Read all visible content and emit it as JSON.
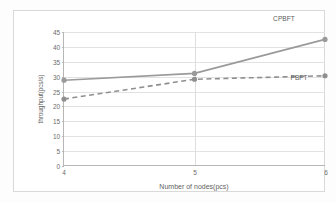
{
  "chart_data": {
    "type": "line",
    "title": "",
    "xlabel": "Number of nodes(pcs)",
    "ylabel": "throughput(pcs/s)",
    "categories": [
      4,
      5,
      6
    ],
    "xtick_labels": [
      "4",
      "5",
      "6"
    ],
    "ytick_labels": [
      "0",
      "5",
      "10",
      "15",
      "20",
      "25",
      "30",
      "35",
      "40",
      "45"
    ],
    "yticks": [
      0,
      5,
      10,
      15,
      20,
      25,
      30,
      35,
      40,
      45
    ],
    "ylim": [
      0,
      45
    ],
    "grid": "horizontal",
    "legend": "none",
    "series": [
      {
        "name": "CPBFT",
        "values": [
          28.7,
          31.0,
          42.5
        ],
        "style": "solid",
        "color": "#9a9a9a",
        "marker": "circle",
        "annotation": "CPBFT"
      },
      {
        "name": "PBFT",
        "values": [
          22.3,
          29.0,
          30.2
        ],
        "style": "dashed",
        "color": "#8f8f8f",
        "marker": "circle",
        "annotation": "PBFT"
      }
    ],
    "annotations": [
      {
        "text": "CPBFT",
        "x_px": 283,
        "y_px": 17
      },
      {
        "text": "PBFT",
        "x_px": 298,
        "y_px": 76
      }
    ],
    "colors": {
      "background": "#ffffff",
      "frame": "#d9d9d9",
      "axis": "#b6b6b6",
      "gridline": "#e2e2e2",
      "text": "#6b6b6b"
    }
  }
}
